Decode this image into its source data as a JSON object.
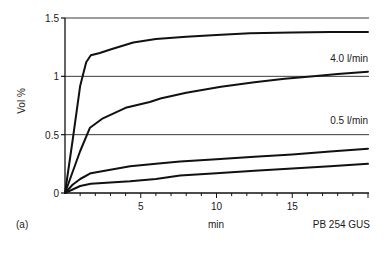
{
  "chart_data": {
    "type": "line",
    "title": "",
    "panel_label": "(a)",
    "figure_code": "PB 254 GUS",
    "xlabel": "min",
    "ylabel": "Vol %",
    "xlim": [
      0,
      20
    ],
    "ylim": [
      0,
      1.5
    ],
    "xticks": [
      5,
      10,
      15
    ],
    "xtick_labels": [
      "5",
      "10",
      "15"
    ],
    "xminor_step": 1,
    "yticks": [
      0,
      0.5,
      1,
      1.5
    ],
    "ytick_labels": [
      "0",
      "0.5",
      "1",
      "1.5"
    ],
    "grid": {
      "horizontal": true,
      "vertical": false,
      "values": [
        0.5,
        1,
        1.5
      ]
    },
    "legend": {
      "position": "inline"
    },
    "annotations": [
      {
        "text": "4.0 l/min",
        "x": 20,
        "y": 1.1,
        "align": "right"
      },
      {
        "text": "0.5 l/min",
        "x": 20,
        "y": 0.6,
        "align": "right"
      }
    ],
    "series": [
      {
        "name": "curve-1 (highest)",
        "x": [
          0,
          0.5,
          1.0,
          1.4,
          1.7,
          2.3,
          3.0,
          4.5,
          6.0,
          8.0,
          10.0,
          12.2,
          15.0,
          17.5,
          20.0
        ],
        "y": [
          0,
          0.45,
          0.92,
          1.12,
          1.18,
          1.2,
          1.23,
          1.29,
          1.32,
          1.34,
          1.355,
          1.37,
          1.375,
          1.38,
          1.38
        ]
      },
      {
        "name": "curve-2",
        "x": [
          0,
          0.5,
          1.0,
          1.65,
          2.5,
          4.0,
          5.6,
          6.3,
          8.0,
          10.3,
          12.5,
          14.5,
          16.4,
          18.0,
          20.0
        ],
        "y": [
          0,
          0.18,
          0.36,
          0.56,
          0.64,
          0.73,
          0.78,
          0.81,
          0.86,
          0.91,
          0.95,
          0.98,
          1.0,
          1.02,
          1.04
        ]
      },
      {
        "name": "curve-3",
        "x": [
          0,
          0.5,
          1.0,
          1.7,
          3.0,
          4.3,
          6.0,
          7.6,
          10.0,
          12.5,
          15.0,
          17.5,
          20.0
        ],
        "y": [
          0,
          0.07,
          0.12,
          0.17,
          0.2,
          0.23,
          0.25,
          0.27,
          0.29,
          0.31,
          0.33,
          0.355,
          0.38
        ]
      },
      {
        "name": "curve-4 (lowest)",
        "x": [
          0,
          0.5,
          1.0,
          1.7,
          3.0,
          4.3,
          6.0,
          7.6,
          10.0,
          12.5,
          15.0,
          17.5,
          20.0
        ],
        "y": [
          0,
          0.03,
          0.06,
          0.08,
          0.09,
          0.1,
          0.12,
          0.15,
          0.17,
          0.19,
          0.21,
          0.23,
          0.25
        ]
      }
    ],
    "colors": {
      "line": "#111111",
      "grid": "#222222",
      "axis": "#111111"
    }
  }
}
